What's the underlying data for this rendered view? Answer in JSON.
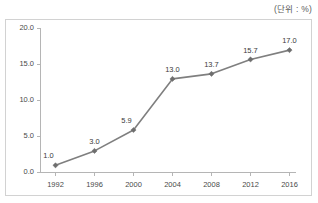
{
  "unit_note": "(단위 : %)",
  "chart_data": {
    "type": "line",
    "title": "",
    "subtitle": "",
    "xlabel": "",
    "ylabel": "",
    "unit_note": "(단위 : %)",
    "categories": [
      "1992",
      "1996",
      "2000",
      "2004",
      "2008",
      "2012",
      "2016"
    ],
    "values": [
      1.0,
      3.0,
      5.9,
      13.0,
      13.7,
      15.7,
      17.0
    ],
    "point_labels": [
      "1.0",
      "3.0",
      "5.9",
      "13.0",
      "13.7",
      "15.7",
      "17.0"
    ],
    "ylim": [
      0.0,
      20.0
    ],
    "yticks": [
      0.0,
      5.0,
      10.0,
      15.0,
      20.0
    ],
    "ytick_labels": [
      "0.0",
      "5.0",
      "10.0",
      "15.0",
      "20.0"
    ],
    "xtick_labels": [
      "1992",
      "1996",
      "2000",
      "2004",
      "2008",
      "2012",
      "2016"
    ],
    "grid": false,
    "legend": false,
    "legend_position": "none",
    "series": [
      {
        "name": "",
        "values": [
          1.0,
          3.0,
          5.9,
          13.0,
          13.7,
          15.7,
          17.0
        ],
        "color": "#7f7f7f",
        "marker": "diamond"
      }
    ],
    "colors": {
      "line": "#7f7f7f",
      "marker": "#6e6e6e",
      "axis": "#b5b5b5",
      "frame": "#d2d2d2",
      "text": "#3a3a3a",
      "background": "#ffffff"
    }
  }
}
